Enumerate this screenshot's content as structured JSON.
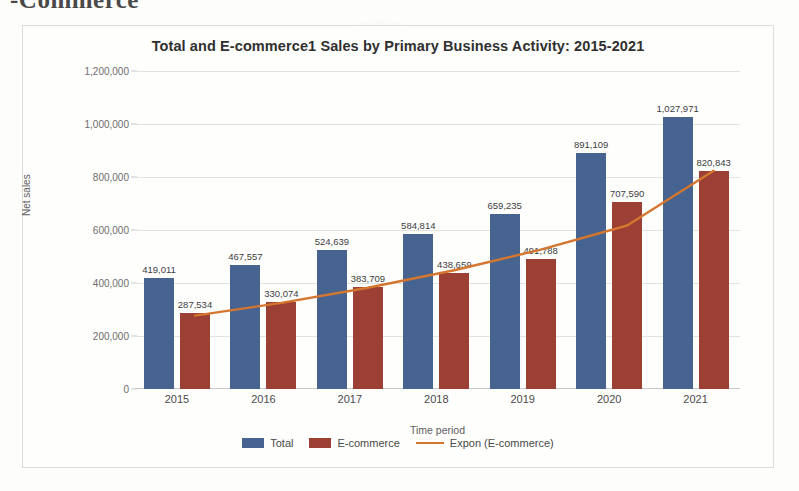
{
  "document": {
    "cutoff_heading": "-Commerce"
  },
  "chart_data": {
    "type": "bar",
    "title": "Total and E-commerce1 Sales by Primary Business Activity: 2015-2021",
    "xlabel": "Time period",
    "ylabel": "Net sales",
    "categories": [
      "2015",
      "2016",
      "2017",
      "2018",
      "2019",
      "2020",
      "2021"
    ],
    "ylim": [
      0,
      1200000
    ],
    "yticks": [
      "0",
      "200,000",
      "400,000",
      "600,000",
      "800,000",
      "1,000,000",
      "1,200,000"
    ],
    "ytick_values": [
      0,
      200000,
      400000,
      600000,
      800000,
      1000000,
      1200000
    ],
    "grid": true,
    "legend_position": "bottom",
    "series": [
      {
        "name": "Total",
        "type": "bar",
        "color": "#46648f",
        "values": [
          419011,
          467557,
          524639,
          584814,
          659235,
          891109,
          1027971
        ],
        "labels": [
          "419,011",
          "467,557",
          "524,639",
          "584,814",
          "659,235",
          "891,109",
          "1,027,971"
        ]
      },
      {
        "name": "E-commerce",
        "type": "bar",
        "color": "#9c3f34",
        "values": [
          287534,
          330074,
          383709,
          438659,
          491788,
          707590,
          820843
        ],
        "labels": [
          "287,534",
          "330,074",
          "383,709",
          "438,659",
          "491,788",
          "707,590",
          "820,843"
        ]
      },
      {
        "name": "Expon (E-commerce)",
        "type": "line",
        "color": "#d4762f",
        "values": [
          277000,
          325000,
          382000,
          448000,
          526000,
          617000,
          824000
        ]
      }
    ]
  }
}
